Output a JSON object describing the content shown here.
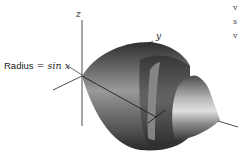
{
  "figure": {
    "labels": {
      "radius_prefix": "Radius",
      "radius_equals": " = ",
      "radius_expr": "sin x",
      "z_axis": "z",
      "y_axis": "y"
    },
    "edge_text_fragments": [
      "v",
      "s",
      "v"
    ],
    "colors": {
      "surface_dark": "#3a3a3a",
      "surface_mid": "#7a7a7a",
      "surface_light": "#c8c8c8",
      "axis": "#222222",
      "background": "#ffffff"
    }
  }
}
